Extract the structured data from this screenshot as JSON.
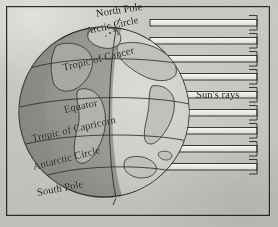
{
  "figure": {
    "kind": "earth-insolation-diagram",
    "title": "",
    "background_color": "#c9c7c2",
    "ink_color": "#1d1b19"
  },
  "globe": {
    "name": "earth-globe",
    "center": {
      "x": 104,
      "y": 112
    },
    "radius": 85,
    "lit_side_color": "#cdcbc6",
    "dark_side_color": "#8f8d88",
    "ocean_color": "#bfbdb8",
    "terminator_label": "day-night-terminator"
  },
  "latitude_labels": [
    {
      "id": "north-pole",
      "text": "North Pole"
    },
    {
      "id": "arctic-circle",
      "text": "Arctic Circle"
    },
    {
      "id": "tropic-of-cancer",
      "text": "Tropic of Cancer"
    },
    {
      "id": "equator",
      "text": "Equator"
    },
    {
      "id": "tropic-of-capricorn",
      "text": "Tropic of Capricorn"
    },
    {
      "id": "antarctic-circle",
      "text": "Antarctic Circle"
    },
    {
      "id": "south-pole",
      "text": "South Pole"
    }
  ],
  "sun_rays": {
    "label": "Sun's rays",
    "count": 9,
    "direction": "right-to-left",
    "rows_y": [
      22,
      40,
      58,
      76,
      94,
      112,
      130,
      148,
      166
    ],
    "bar_color": "#efeeec",
    "outline_color": "#2a2825"
  }
}
